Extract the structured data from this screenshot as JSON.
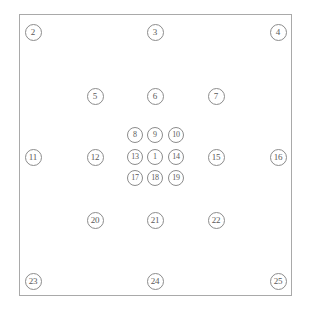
{
  "diagram": {
    "background_color": "#ffffff",
    "frame": {
      "name": "outer-frame",
      "x": 19,
      "y": 14,
      "width": 273,
      "height": 282,
      "stroke_color": "#a9a9a9",
      "fill_color": "#ffffff"
    },
    "node_style": {
      "diameter": 17,
      "inner_diameter": 16,
      "stroke_color": "#8c8c8c",
      "text_color": "#5a5a5a",
      "font_size_outer": 9,
      "font_size_inner": 8
    },
    "groups": [
      {
        "id": "corner-ring",
        "label": "Frame corners"
      },
      {
        "id": "edge-ring",
        "label": "Frame edge midpoints"
      },
      {
        "id": "middle-ring",
        "label": "Middle ring"
      },
      {
        "id": "inner-grid",
        "label": "Inner 3 by 3 grid"
      },
      {
        "id": "center",
        "label": "Center node"
      }
    ],
    "nodes": [
      {
        "label": "2",
        "x": 33,
        "y": 32,
        "group": "corner-ring",
        "size": 17,
        "font": 9
      },
      {
        "label": "3",
        "x": 155,
        "y": 32,
        "group": "edge-ring",
        "size": 17,
        "font": 9
      },
      {
        "label": "4",
        "x": 278,
        "y": 32,
        "group": "corner-ring",
        "size": 17,
        "font": 9
      },
      {
        "label": "5",
        "x": 95,
        "y": 96,
        "group": "middle-ring",
        "size": 17,
        "font": 9
      },
      {
        "label": "6",
        "x": 155,
        "y": 96,
        "group": "middle-ring",
        "size": 17,
        "font": 9
      },
      {
        "label": "7",
        "x": 216,
        "y": 96,
        "group": "middle-ring",
        "size": 17,
        "font": 9
      },
      {
        "label": "8",
        "x": 135,
        "y": 135,
        "group": "inner-grid",
        "size": 16,
        "font": 8
      },
      {
        "label": "9",
        "x": 155,
        "y": 135,
        "group": "inner-grid",
        "size": 16,
        "font": 8
      },
      {
        "label": "10",
        "x": 176,
        "y": 135,
        "group": "inner-grid",
        "size": 16,
        "font": 8
      },
      {
        "label": "11",
        "x": 33,
        "y": 157,
        "group": "edge-ring",
        "size": 17,
        "font": 9
      },
      {
        "label": "12",
        "x": 95,
        "y": 157,
        "group": "middle-ring",
        "size": 17,
        "font": 9
      },
      {
        "label": "13",
        "x": 135,
        "y": 157,
        "group": "inner-grid",
        "size": 16,
        "font": 8
      },
      {
        "label": "1",
        "x": 155,
        "y": 157,
        "group": "center",
        "size": 16,
        "font": 8
      },
      {
        "label": "14",
        "x": 176,
        "y": 157,
        "group": "inner-grid",
        "size": 16,
        "font": 8
      },
      {
        "label": "15",
        "x": 216,
        "y": 157,
        "group": "middle-ring",
        "size": 17,
        "font": 9
      },
      {
        "label": "16",
        "x": 278,
        "y": 157,
        "group": "edge-ring",
        "size": 17,
        "font": 9
      },
      {
        "label": "17",
        "x": 135,
        "y": 178,
        "group": "inner-grid",
        "size": 16,
        "font": 8
      },
      {
        "label": "18",
        "x": 155,
        "y": 178,
        "group": "inner-grid",
        "size": 16,
        "font": 8
      },
      {
        "label": "19",
        "x": 176,
        "y": 178,
        "group": "inner-grid",
        "size": 16,
        "font": 8
      },
      {
        "label": "20",
        "x": 95,
        "y": 220,
        "group": "middle-ring",
        "size": 17,
        "font": 9
      },
      {
        "label": "21",
        "x": 155,
        "y": 220,
        "group": "middle-ring",
        "size": 17,
        "font": 9
      },
      {
        "label": "22",
        "x": 216,
        "y": 220,
        "group": "middle-ring",
        "size": 17,
        "font": 9
      },
      {
        "label": "23",
        "x": 33,
        "y": 281,
        "group": "corner-ring",
        "size": 17,
        "font": 9
      },
      {
        "label": "24",
        "x": 155,
        "y": 281,
        "group": "edge-ring",
        "size": 17,
        "font": 9
      },
      {
        "label": "25",
        "x": 278,
        "y": 281,
        "group": "corner-ring",
        "size": 17,
        "font": 9
      }
    ]
  }
}
